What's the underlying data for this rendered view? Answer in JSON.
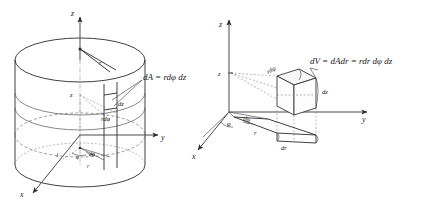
{
  "figure": {
    "background_color": "#ffffff",
    "ink_color": "#2b2b2b",
    "panels": [
      {
        "id": "left",
        "name": "cylinder-area-element",
        "description": "Cylinder with axes x, y, z showing a surface area element dA on the lateral surface",
        "axes": [
          {
            "name": "z-axis",
            "label": "z"
          },
          {
            "name": "y-axis",
            "label": "y"
          },
          {
            "name": "x-axis",
            "label": "x"
          }
        ],
        "labels": {
          "axis_z": "z",
          "axis_y": "y",
          "axis_x": "x",
          "radius": "r",
          "height": "z",
          "unit": "1",
          "angle_phi": "φ",
          "angle_dphi": "dφ",
          "base_radius": "r",
          "arc_length": "rdφ",
          "element_height": "dz",
          "area_equation": "dA = rdφ dz"
        }
      },
      {
        "id": "right",
        "name": "volume-element",
        "description": "Axes x, y, z with a wedge-shaped volume element dV built from dA and dr",
        "axes": [
          {
            "name": "z-axis",
            "label": "z"
          },
          {
            "name": "y-axis",
            "label": "y"
          },
          {
            "name": "x-axis",
            "label": "x"
          }
        ],
        "labels": {
          "axis_z": "z",
          "axis_y": "y",
          "axis_x": "x",
          "height": "z",
          "angle_phi": "φ",
          "angle_dphi": "dφ",
          "radius": "r",
          "radial_thickness": "dr",
          "arc_length": "rdφ",
          "element_height": "dz",
          "volume_equation": "dV = dAdr = rdr dφ dz"
        }
      }
    ]
  }
}
